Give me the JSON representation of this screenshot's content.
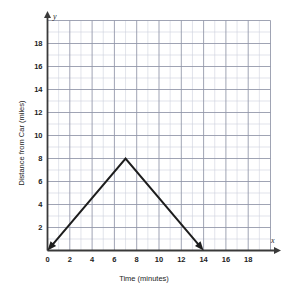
{
  "chart_data": {
    "type": "line",
    "title": "",
    "xlabel": "Time (minutes)",
    "ylabel": "Distance from Car (miles)",
    "x_axis_name": "x",
    "y_axis_name": "y",
    "xlim": [
      0,
      20
    ],
    "ylim": [
      0,
      20
    ],
    "x_ticks": [
      0,
      2,
      4,
      6,
      8,
      10,
      12,
      14,
      16,
      18
    ],
    "y_ticks": [
      0,
      2,
      4,
      6,
      8,
      10,
      12,
      14,
      16,
      18
    ],
    "x_tick_labels": [
      "0",
      "2",
      "4",
      "6",
      "8",
      "10",
      "12",
      "14",
      "16",
      "18"
    ],
    "y_tick_labels": [
      "0",
      "2",
      "4",
      "6",
      "8",
      "10",
      "12",
      "14",
      "16",
      "18"
    ],
    "grid": true,
    "grid_minor_step": 1,
    "grid_major_step": 2,
    "grid_minor_color": "#cfd2de",
    "grid_major_color": "#8f93a6",
    "axis_color": "#3a3a3a",
    "series": [
      {
        "name": "Distance from car",
        "color": "#1d1d1d",
        "arrow_start": true,
        "arrow_end": true,
        "points": [
          {
            "x": 0,
            "y": 0
          },
          {
            "x": 7,
            "y": 8
          },
          {
            "x": 14,
            "y": 0
          }
        ]
      }
    ],
    "legend": null,
    "legend_position": "none"
  },
  "labels": {
    "x_axis_title": "Time (minutes)",
    "y_axis_title": "Distance from Car (miles)",
    "x_axis_symbol": "x",
    "y_axis_symbol": "y"
  }
}
